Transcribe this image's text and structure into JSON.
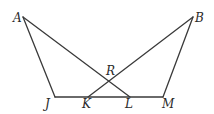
{
  "diagram": {
    "type": "geometry",
    "points": [
      {
        "id": "A",
        "label": "A",
        "x": 23,
        "y": 17,
        "lx": 13,
        "ly": 22
      },
      {
        "id": "B",
        "label": "B",
        "x": 193,
        "y": 17,
        "lx": 195,
        "ly": 22
      },
      {
        "id": "J",
        "label": "J",
        "x": 55,
        "y": 97,
        "lx": 45,
        "ly": 108
      },
      {
        "id": "K",
        "label": "K",
        "x": 88,
        "y": 97,
        "lx": 82,
        "ly": 108
      },
      {
        "id": "L",
        "label": "L",
        "x": 130,
        "y": 97,
        "lx": 125,
        "ly": 108
      },
      {
        "id": "M",
        "label": "M",
        "x": 163,
        "y": 97,
        "lx": 162,
        "ly": 108
      },
      {
        "id": "R",
        "label": "R",
        "x": 109,
        "y": 80,
        "lx": 106,
        "ly": 75
      }
    ],
    "segments": [
      {
        "from": "A",
        "to": "J"
      },
      {
        "from": "A",
        "to": "L"
      },
      {
        "from": "B",
        "to": "K"
      },
      {
        "from": "B",
        "to": "M"
      },
      {
        "from": "J",
        "to": "M"
      }
    ],
    "intersection": {
      "point": "R",
      "of": [
        "AL",
        "BK"
      ]
    },
    "colors": {
      "stroke": "#3a3a3a",
      "label": "#2a2a2a",
      "background": "#ffffff"
    }
  }
}
